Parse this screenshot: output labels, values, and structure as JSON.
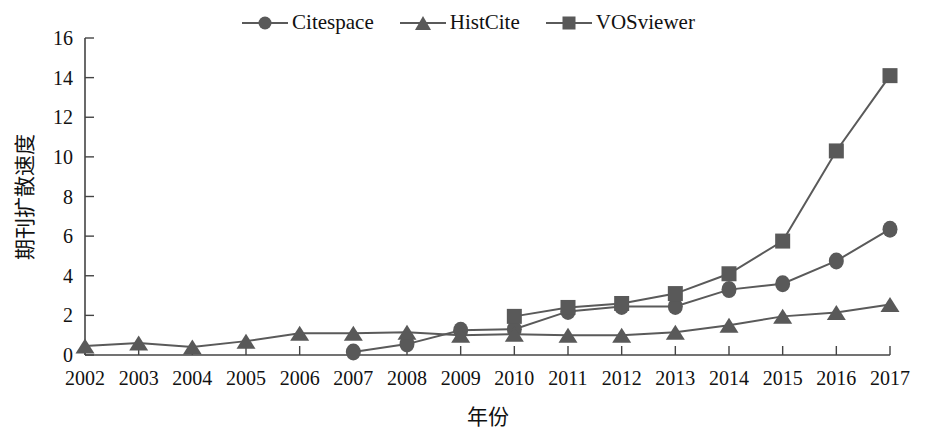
{
  "chart_data": {
    "type": "line",
    "title": "",
    "xlabel": "年份",
    "ylabel": "期刊扩散速度",
    "x": [
      2002,
      2003,
      2004,
      2005,
      2006,
      2007,
      2008,
      2009,
      2010,
      2011,
      2012,
      2013,
      2014,
      2015,
      2016,
      2017
    ],
    "categories": [
      "2002",
      "2003",
      "2004",
      "2005",
      "2006",
      "2007",
      "2008",
      "2009",
      "2010",
      "2011",
      "2012",
      "2013",
      "2014",
      "2015",
      "2016",
      "2017"
    ],
    "xlim": [
      2002,
      2017
    ],
    "ylim": [
      0,
      16
    ],
    "yticks": [
      0,
      2,
      4,
      6,
      8,
      10,
      12,
      14,
      16
    ],
    "ytick_labels": [
      "0",
      "2",
      "4",
      "6",
      "8",
      "10",
      "12",
      "14",
      "16"
    ],
    "grid": false,
    "legend_position": "top-center",
    "series": [
      {
        "name": "Citespace",
        "marker": "circle",
        "color": "#595959",
        "x": [
          2007,
          2008,
          2009,
          2010,
          2011,
          2012,
          2013,
          2014,
          2015,
          2016,
          2017
        ],
        "values": [
          0.15,
          0.55,
          1.25,
          1.3,
          2.2,
          2.45,
          2.45,
          3.3,
          3.6,
          4.75,
          6.35
        ]
      },
      {
        "name": "HistCite",
        "marker": "triangle",
        "color": "#595959",
        "x": [
          2002,
          2003,
          2004,
          2005,
          2006,
          2007,
          2008,
          2009,
          2010,
          2011,
          2012,
          2013,
          2014,
          2015,
          2016,
          2017
        ],
        "values": [
          0.45,
          0.6,
          0.4,
          0.7,
          1.1,
          1.1,
          1.15,
          1.0,
          1.05,
          1.0,
          1.0,
          1.15,
          1.5,
          1.95,
          2.15,
          2.55
        ]
      },
      {
        "name": "VOSviewer",
        "marker": "square",
        "color": "#595959",
        "x": [
          2010,
          2011,
          2012,
          2013,
          2014,
          2015,
          2016,
          2017
        ],
        "values": [
          1.95,
          2.4,
          2.6,
          3.1,
          4.1,
          5.75,
          10.3,
          14.1
        ]
      }
    ]
  },
  "legend": {
    "items": [
      {
        "label": "Citespace",
        "marker": "circle"
      },
      {
        "label": "HistCite",
        "marker": "triangle"
      },
      {
        "label": "VOSviewer",
        "marker": "square"
      }
    ]
  },
  "axes": {
    "y_title": "期刊扩散速度",
    "x_title": "年份"
  },
  "colors": {
    "series": "#595959",
    "axis": "#444444",
    "text": "#111111",
    "background": "#ffffff"
  }
}
